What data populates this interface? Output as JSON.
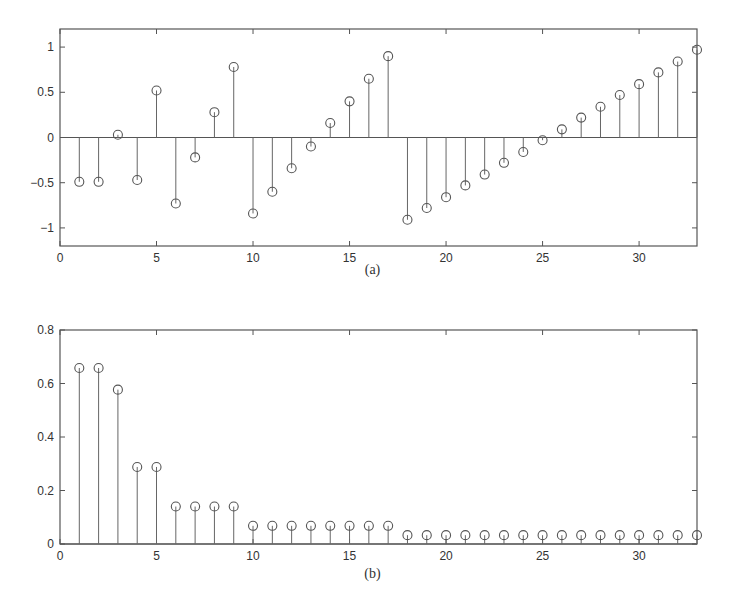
{
  "chart_data": [
    {
      "type": "stem",
      "caption": "(a)",
      "title": "",
      "xlabel": "",
      "ylabel": "",
      "xlim": [
        0,
        33
      ],
      "ylim": [
        -1.2,
        1.2
      ],
      "xticks": [
        0,
        5,
        10,
        15,
        20,
        25,
        30
      ],
      "yticks": [
        -1,
        -0.5,
        0,
        0.5,
        1
      ],
      "xtick_labels": [
        "0",
        "5",
        "10",
        "15",
        "20",
        "25",
        "30"
      ],
      "ytick_labels": [
        "−1",
        "−0.5",
        "0",
        "0.5",
        "1"
      ],
      "grid": false,
      "x": [
        1,
        2,
        3,
        4,
        5,
        6,
        7,
        8,
        9,
        10,
        11,
        12,
        13,
        14,
        15,
        16,
        17,
        18,
        19,
        20,
        21,
        22,
        23,
        24,
        25,
        26,
        27,
        28,
        29,
        30,
        31,
        32,
        33
      ],
      "values": [
        -0.49,
        -0.49,
        0.03,
        -0.47,
        0.52,
        -0.73,
        -0.22,
        0.28,
        0.78,
        -0.84,
        -0.6,
        -0.34,
        -0.1,
        0.16,
        0.4,
        0.65,
        0.9,
        -0.91,
        -0.78,
        -0.66,
        -0.53,
        -0.41,
        -0.28,
        -0.16,
        -0.03,
        0.09,
        0.22,
        0.34,
        0.47,
        0.59,
        0.72,
        0.84,
        0.97
      ]
    },
    {
      "type": "stem",
      "caption": "(b)",
      "title": "",
      "xlabel": "",
      "ylabel": "",
      "xlim": [
        0,
        33
      ],
      "ylim": [
        0,
        0.8
      ],
      "xticks": [
        0,
        5,
        10,
        15,
        20,
        25,
        30
      ],
      "yticks": [
        0,
        0.2,
        0.4,
        0.6,
        0.8
      ],
      "xtick_labels": [
        "0",
        "5",
        "10",
        "15",
        "20",
        "25",
        "30"
      ],
      "ytick_labels": [
        "0",
        "0.2",
        "0.4",
        "0.6",
        "0.8"
      ],
      "grid": false,
      "x": [
        1,
        2,
        3,
        4,
        5,
        6,
        7,
        8,
        9,
        10,
        11,
        12,
        13,
        14,
        15,
        16,
        17,
        18,
        19,
        20,
        21,
        22,
        23,
        24,
        25,
        26,
        27,
        28,
        29,
        30,
        31,
        32,
        33
      ],
      "values": [
        0.658,
        0.658,
        0.577,
        0.288,
        0.288,
        0.14,
        0.14,
        0.14,
        0.14,
        0.068,
        0.068,
        0.068,
        0.068,
        0.068,
        0.068,
        0.068,
        0.068,
        0.033,
        0.033,
        0.033,
        0.033,
        0.033,
        0.033,
        0.033,
        0.033,
        0.033,
        0.033,
        0.033,
        0.033,
        0.033,
        0.033,
        0.033,
        0.033
      ]
    }
  ],
  "colors": {
    "axis": "#555555",
    "stem": "#666666",
    "marker": "#555555"
  }
}
